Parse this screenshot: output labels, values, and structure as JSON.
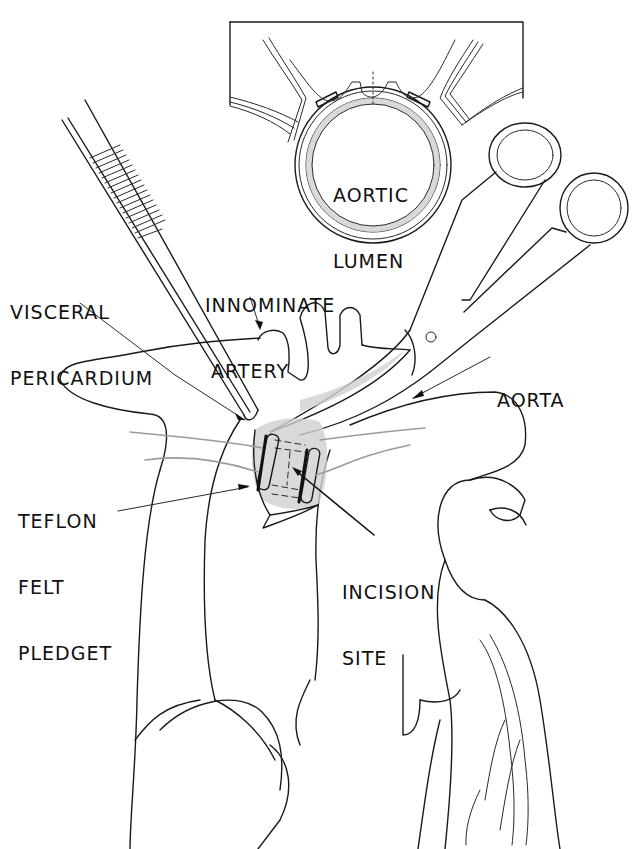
{
  "figure": {
    "type": "surgical illustration",
    "style": "black line drawing on white",
    "background_color": "#ffffff",
    "line_color": "#1a1a1a"
  },
  "inset": {
    "label_line1": "AORTIC",
    "label_line2": "LUMEN"
  },
  "labels": {
    "visceral_pericardium": {
      "line1": "VISCERAL",
      "line2": "PERICARDIUM"
    },
    "innominate_artery": {
      "line1": "INNOMINATE",
      "line2": "ARTERY"
    },
    "aorta": {
      "line1": "AORTA"
    },
    "teflon_felt_pledget": {
      "line1": "TEFLON",
      "line2": "FELT",
      "line3": "PLEDGET"
    },
    "incision_site": {
      "line1": "INCISION",
      "line2": "SITE"
    }
  },
  "instruments": [
    {
      "name": "forceps",
      "icon": "forceps-icon"
    },
    {
      "name": "scissors",
      "icon": "scissors-icon"
    }
  ]
}
